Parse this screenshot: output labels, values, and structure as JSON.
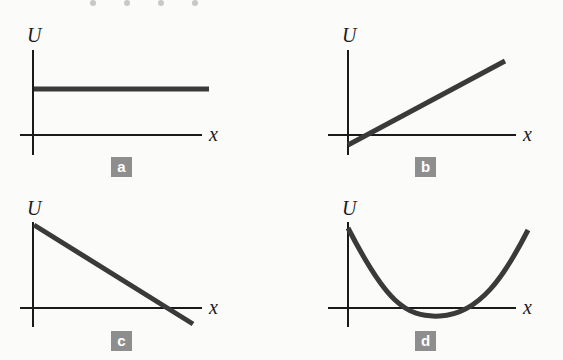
{
  "figure": {
    "background": "#fbfbfa",
    "curve_color": "#3a3a3a",
    "axis_color": "#1a1a1a",
    "badge_color": "#8e8e8e",
    "panels": [
      {
        "id": "a",
        "ylabel": "U",
        "xlabel": "x",
        "badge": "a",
        "description": "constant U"
      },
      {
        "id": "b",
        "ylabel": "U",
        "xlabel": "x",
        "badge": "b",
        "description": "U increasing linearly, starting slightly below zero"
      },
      {
        "id": "c",
        "ylabel": "U",
        "xlabel": "x",
        "badge": "c",
        "description": "U decreasing linearly, crossing below zero"
      },
      {
        "id": "d",
        "ylabel": "U",
        "xlabel": "x",
        "badge": "d",
        "description": "parabolic U with minimum slightly below zero"
      }
    ]
  }
}
